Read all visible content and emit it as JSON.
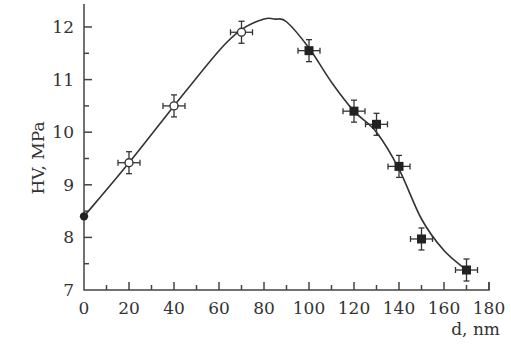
{
  "chart_data": {
    "type": "scatter",
    "title": "",
    "xlabel": "d, nm",
    "ylabel": "HV, MPa",
    "xlim": [
      0,
      180
    ],
    "ylim": [
      7,
      12.4
    ],
    "x_ticks": [
      0,
      20,
      40,
      60,
      80,
      100,
      120,
      140,
      160,
      180
    ],
    "x_tick_labels": [
      "0",
      "20",
      "40",
      "60",
      "80",
      "100",
      "120",
      "140",
      "160",
      "180"
    ],
    "y_ticks": [
      7,
      8,
      9,
      10,
      11,
      12
    ],
    "y_tick_labels": [
      "7",
      "8",
      "9",
      "10",
      "11",
      "12"
    ],
    "grid": false,
    "legend": null,
    "series": [
      {
        "name": "filled-circle",
        "marker": "filled-circle",
        "x": [
          0
        ],
        "y": [
          8.4
        ],
        "error_bars": false
      },
      {
        "name": "open-circle",
        "marker": "open-circle",
        "x": [
          20,
          40,
          70
        ],
        "y": [
          9.42,
          10.5,
          11.9
        ],
        "error_bars": true
      },
      {
        "name": "filled-square",
        "marker": "filled-square",
        "x": [
          100,
          120,
          130,
          140,
          150,
          170
        ],
        "y": [
          11.55,
          10.4,
          10.15,
          9.35,
          7.97,
          7.38
        ],
        "error_bars": true
      }
    ],
    "fit_curve": {
      "x": [
        0,
        20,
        40,
        60,
        70,
        80,
        85,
        90,
        100,
        110,
        120,
        130,
        140,
        150,
        160,
        170
      ],
      "y": [
        8.4,
        9.42,
        10.5,
        11.55,
        11.95,
        12.15,
        12.15,
        12.1,
        11.6,
        10.95,
        10.4,
        10.0,
        9.3,
        8.35,
        7.75,
        7.38
      ]
    }
  }
}
